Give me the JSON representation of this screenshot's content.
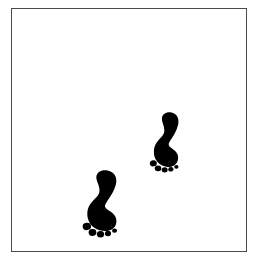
{
  "figure": {
    "description": "A white square panel outlined with a thin dark gray border containing two solid black bare footprints arranged diagonally, suggesting a person walking toward the upper right.",
    "background_color": "#ffffff",
    "panel_color": "#ffffff",
    "border_color": "#4a4a4a",
    "ink_color": "#000000",
    "panel": {
      "x": 11,
      "y": 8,
      "width": 236,
      "height": 244,
      "border_width": 1
    },
    "footprints": [
      {
        "id": "footprint-front-upper-right",
        "label": "Upper right footprint",
        "side": "right-foot",
        "order": "leading",
        "size": "smaller",
        "bounds": {
          "x": 151,
          "y": 111,
          "width": 33,
          "height": 58
        },
        "rotation_deg": 12,
        "toe_count": 5,
        "big_toe_position": "merged-into-ball-left",
        "separate_toe_dots": 4
      },
      {
        "id": "footprint-rear-lower-left",
        "label": "Lower left footprint",
        "side": "right-foot",
        "order": "trailing",
        "size": "larger",
        "bounds": {
          "x": 84,
          "y": 169,
          "width": 40,
          "height": 60
        },
        "rotation_deg": 12,
        "toe_count": 5,
        "big_toe_position": "merged-into-ball-left",
        "separate_toe_dots": 4
      }
    ]
  }
}
